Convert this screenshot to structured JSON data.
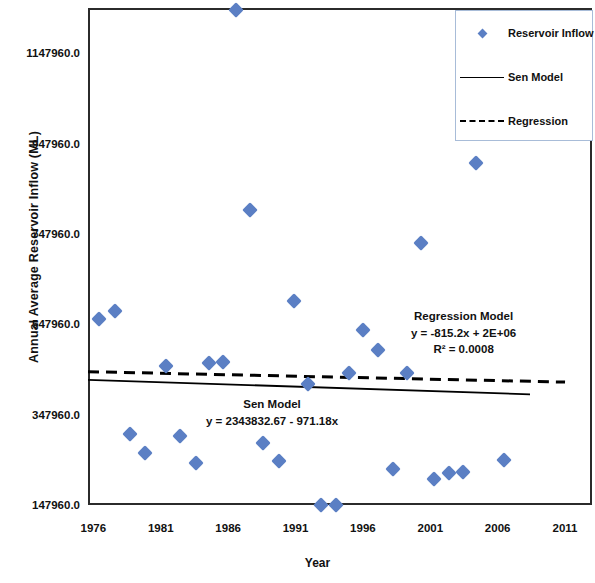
{
  "chart_data": {
    "type": "scatter",
    "title": "",
    "xlabel": "Year",
    "ylabel": "Annual Average Reservoir Inflow (ML)",
    "xlim": [
      1975.6,
      2013.0
    ],
    "ylim": [
      147960.0,
      1247960.0
    ],
    "grid": false,
    "xticks": [
      "1976",
      "1981",
      "1986",
      "1991",
      "1996",
      "2001",
      "2006",
      "2011"
    ],
    "xtick_values": [
      1976,
      1981,
      1986,
      1991,
      1996,
      2001,
      2006,
      2011
    ],
    "yticks": [
      "147960.0",
      "347960.0",
      "547960.0",
      "747960.0",
      "947960.0",
      "1147960.0"
    ],
    "ytick_values": [
      147960,
      347960,
      547960,
      747960,
      947960,
      1147960
    ],
    "marker_color": "#5b7fc4",
    "line_color": "#000000",
    "series": [
      {
        "name": "Reservoir Inflow",
        "type": "scatter",
        "marker": "diamond",
        "color": "#5b7fc4",
        "points": [
          {
            "x": 1976.4,
            "y": 560000
          },
          {
            "x": 1977.6,
            "y": 578000
          },
          {
            "x": 1978.7,
            "y": 305000
          },
          {
            "x": 1979.8,
            "y": 262000
          },
          {
            "x": 1981.4,
            "y": 455000
          },
          {
            "x": 1982.4,
            "y": 301000
          },
          {
            "x": 1983.6,
            "y": 240000
          },
          {
            "x": 1984.6,
            "y": 463000
          },
          {
            "x": 1985.6,
            "y": 465000
          },
          {
            "x": 1986.6,
            "y": 1250000
          },
          {
            "x": 1987.6,
            "y": 800000
          },
          {
            "x": 1988.6,
            "y": 286000
          },
          {
            "x": 1989.8,
            "y": 246000
          },
          {
            "x": 1990.9,
            "y": 600000
          },
          {
            "x": 1991.9,
            "y": 415000
          },
          {
            "x": 1992.9,
            "y": 148000
          },
          {
            "x": 1994.0,
            "y": 148000
          },
          {
            "x": 1995.0,
            "y": 440000
          },
          {
            "x": 1996.0,
            "y": 535000
          },
          {
            "x": 1997.1,
            "y": 492000
          },
          {
            "x": 1998.2,
            "y": 228000
          },
          {
            "x": 1999.3,
            "y": 440000
          },
          {
            "x": 2000.3,
            "y": 728000
          },
          {
            "x": 2001.3,
            "y": 205000
          },
          {
            "x": 2002.4,
            "y": 219000
          },
          {
            "x": 2003.4,
            "y": 222000
          },
          {
            "x": 2004.4,
            "y": 905000
          },
          {
            "x": 2006.5,
            "y": 248000
          }
        ]
      },
      {
        "name": "Sen Model",
        "type": "line",
        "style": "solid",
        "color": "#000000",
        "equation": "y = 2343832.67 - 971.18x",
        "slope": -971.18,
        "intercept": 2343832.67,
        "endpoints": [
          {
            "x": 1975.6,
            "y": 425000
          },
          {
            "x": 2008.4,
            "y": 393000
          }
        ]
      },
      {
        "name": "Regression",
        "type": "line",
        "style": "dashed",
        "color": "#000000",
        "equation": "y = -815.2x + 2E+06",
        "r_squared": "0.0008",
        "slope": -815.2,
        "endpoints": [
          {
            "x": 1975.6,
            "y": 443000
          },
          {
            "x": 2011.0,
            "y": 420000
          }
        ]
      }
    ],
    "annotations": [
      {
        "id": "sen-model-annotation",
        "title": "Sen Model",
        "equation": "y = 2343832.67 - 971.18x",
        "x": 1996.0,
        "y": 340000
      },
      {
        "id": "regression-model-annotation",
        "title": "Regression Model",
        "equation": "y = -815.2x + 2E+06",
        "r_squared": "R² = 0.0008",
        "x": 2001.5,
        "y": 520000
      }
    ],
    "legend": {
      "position": "top-right",
      "entries": [
        {
          "label": "Reservoir Inflow",
          "key": "diamond-marker"
        },
        {
          "label": "Sen Model",
          "key": "solid-line"
        },
        {
          "label": "Regression",
          "key": "dashed-line"
        }
      ]
    }
  },
  "axes": {
    "y_title": "Annual Average Reservoir Inflow (ML)",
    "x_title": "Year"
  },
  "annotations": {
    "sen": {
      "title": "Sen Model",
      "equation": "y = 2343832.67 - 971.18x"
    },
    "regression": {
      "title": "Regression Model",
      "equation": "y = -815.2x + 2E+06",
      "r2": "R² = 0.0008"
    }
  },
  "legend": {
    "items": [
      {
        "label": "Reservoir Inflow"
      },
      {
        "label": "Sen Model"
      },
      {
        "label": "Regression"
      }
    ]
  }
}
